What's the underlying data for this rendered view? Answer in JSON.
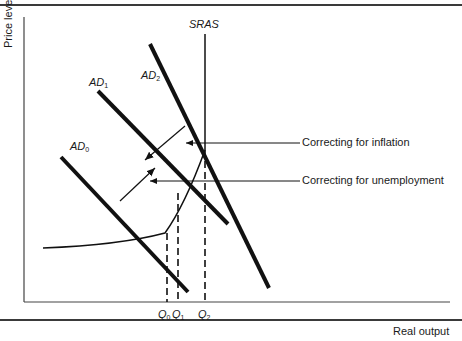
{
  "figure": {
    "y_axis_label": "Price level",
    "x_axis_label": "Real output",
    "curves": {
      "ad0": {
        "label": "AD",
        "sub": "0"
      },
      "ad1": {
        "label": "AD",
        "sub": "1"
      },
      "ad2": {
        "label": "AD",
        "sub": "2"
      },
      "sras": {
        "label": "SRAS"
      }
    },
    "annotations": {
      "inflation": "Correcting for inflation",
      "unemployment": "Correcting for unemployment"
    },
    "quantities": [
      {
        "label": "Q",
        "sub": "0"
      },
      {
        "label": "Q",
        "sub": "1"
      },
      {
        "label": "Q",
        "sub": "2"
      }
    ],
    "colors": {
      "line": "#111111",
      "rule": "#3a3a3a"
    }
  }
}
